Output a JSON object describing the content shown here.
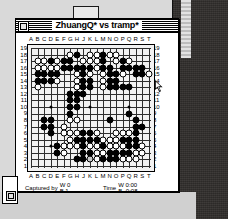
{
  "window": {
    "title": "ZhuangQ* vs tramp*",
    "close_icon": "close-box-icon",
    "zoom_icon": "zoom-box-icon"
  },
  "board": {
    "size": 19,
    "col_labels": [
      "A",
      "B",
      "C",
      "D",
      "E",
      "F",
      "G",
      "H",
      "J",
      "K",
      "L",
      "M",
      "N",
      "O",
      "P",
      "Q",
      "R",
      "S",
      "T"
    ],
    "row_labels": [
      "19",
      "18",
      "17",
      "16",
      "15",
      "14",
      "13",
      "12",
      "11",
      "10",
      "9",
      "8",
      "7",
      "6",
      "5",
      "4",
      "3",
      "2",
      "1"
    ],
    "hoshi": [
      [
        3,
        3
      ],
      [
        9,
        3
      ],
      [
        15,
        3
      ],
      [
        3,
        9
      ],
      [
        9,
        9
      ],
      [
        15,
        9
      ],
      [
        3,
        15
      ],
      [
        9,
        15
      ],
      [
        15,
        15
      ]
    ],
    "black_stones": [
      [
        7,
        1
      ],
      [
        11,
        1
      ],
      [
        3,
        2
      ],
      [
        11,
        2
      ],
      [
        11,
        3
      ],
      [
        12,
        3
      ],
      [
        7,
        3
      ],
      [
        8,
        3
      ],
      [
        9,
        3
      ],
      [
        5,
        2
      ],
      [
        6,
        2
      ],
      [
        5,
        3
      ],
      [
        6,
        3
      ],
      [
        14,
        2
      ],
      [
        14,
        3
      ],
      [
        15,
        3
      ],
      [
        16,
        3
      ],
      [
        17,
        3
      ],
      [
        1,
        4
      ],
      [
        2,
        4
      ],
      [
        3,
        4
      ],
      [
        4,
        4
      ],
      [
        8,
        4
      ],
      [
        12,
        4
      ],
      [
        13,
        4
      ],
      [
        16,
        4
      ],
      [
        17,
        4
      ],
      [
        1,
        5
      ],
      [
        2,
        5
      ],
      [
        3,
        5
      ],
      [
        8,
        5
      ],
      [
        9,
        5
      ],
      [
        12,
        5
      ],
      [
        13,
        5
      ],
      [
        8,
        6
      ],
      [
        9,
        6
      ],
      [
        12,
        6
      ],
      [
        14,
        6
      ],
      [
        15,
        6
      ],
      [
        6,
        7
      ],
      [
        7,
        7
      ],
      [
        8,
        7
      ],
      [
        13,
        6
      ],
      [
        6,
        8
      ],
      [
        7,
        8
      ],
      [
        6,
        9
      ],
      [
        7,
        9
      ],
      [
        6,
        10
      ],
      [
        15,
        10
      ],
      [
        2,
        11
      ],
      [
        3,
        11
      ],
      [
        12,
        11
      ],
      [
        16,
        11
      ],
      [
        2,
        12
      ],
      [
        3,
        12
      ],
      [
        16,
        12
      ],
      [
        17,
        12
      ],
      [
        3,
        13
      ],
      [
        8,
        13
      ],
      [
        9,
        13
      ],
      [
        16,
        13
      ],
      [
        7,
        14
      ],
      [
        8,
        14
      ],
      [
        9,
        14
      ],
      [
        10,
        14
      ],
      [
        14,
        14
      ],
      [
        15,
        14
      ],
      [
        16,
        14
      ],
      [
        4,
        15
      ],
      [
        8,
        15
      ],
      [
        11,
        15
      ],
      [
        15,
        15
      ],
      [
        16,
        15
      ],
      [
        4,
        16
      ],
      [
        8,
        16
      ],
      [
        9,
        16
      ],
      [
        12,
        16
      ],
      [
        13,
        16
      ],
      [
        14,
        16
      ],
      [
        15,
        16
      ],
      [
        7,
        17
      ],
      [
        8,
        17
      ],
      [
        11,
        17
      ],
      [
        12,
        17
      ],
      [
        13,
        17
      ]
    ],
    "white_stones": [
      [
        6,
        1
      ],
      [
        9,
        1
      ],
      [
        10,
        1
      ],
      [
        12,
        1
      ],
      [
        13,
        1
      ],
      [
        1,
        2
      ],
      [
        2,
        2
      ],
      [
        4,
        2
      ],
      [
        8,
        2
      ],
      [
        9,
        2
      ],
      [
        10,
        2
      ],
      [
        13,
        2
      ],
      [
        15,
        2
      ],
      [
        1,
        3
      ],
      [
        2,
        3
      ],
      [
        3,
        3
      ],
      [
        4,
        3
      ],
      [
        10,
        3
      ],
      [
        7,
        4
      ],
      [
        9,
        4
      ],
      [
        11,
        4
      ],
      [
        14,
        4
      ],
      [
        18,
        4
      ],
      [
        4,
        5
      ],
      [
        7,
        5
      ],
      [
        11,
        5
      ],
      [
        1,
        6
      ],
      [
        7,
        6
      ],
      [
        11,
        6
      ],
      [
        7,
        7
      ],
      [
        6,
        11
      ],
      [
        7,
        11
      ],
      [
        5,
        12
      ],
      [
        5,
        13
      ],
      [
        6,
        13
      ],
      [
        7,
        13
      ],
      [
        10,
        13
      ],
      [
        13,
        13
      ],
      [
        14,
        13
      ],
      [
        15,
        13
      ],
      [
        6,
        14
      ],
      [
        11,
        14
      ],
      [
        12,
        14
      ],
      [
        13,
        14
      ],
      [
        5,
        15
      ],
      [
        6,
        15
      ],
      [
        7,
        15
      ],
      [
        9,
        15
      ],
      [
        10,
        15
      ],
      [
        12,
        15
      ],
      [
        13,
        15
      ],
      [
        14,
        15
      ],
      [
        17,
        15
      ],
      [
        5,
        16
      ],
      [
        10,
        16
      ],
      [
        11,
        16
      ],
      [
        16,
        16
      ],
      [
        17,
        16
      ],
      [
        9,
        17
      ],
      [
        10,
        17
      ],
      [
        14,
        17
      ],
      [
        15,
        17
      ],
      [
        16,
        17
      ]
    ],
    "last_move_marker": [
      9,
      17
    ]
  },
  "footer": {
    "captured_label": "Captured by",
    "captured_white": "W 0",
    "captured_black": "B 1",
    "time_label": "Time",
    "time_white": "W 0:00",
    "time_black": "B -0:08"
  },
  "cursor": {
    "icon": "arrow-cursor"
  }
}
